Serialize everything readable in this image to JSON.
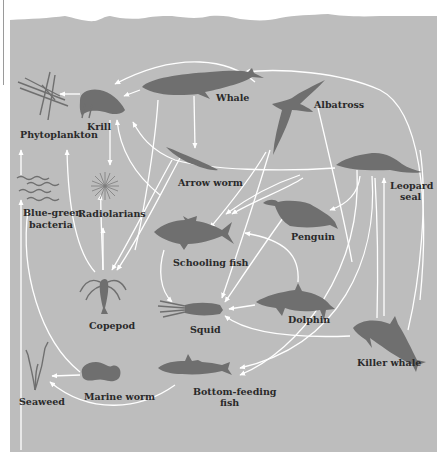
{
  "diagram": {
    "colors": {
      "water": "#bdbdbd",
      "silhouette": "#6f6f6f",
      "arrow": "#ffffff",
      "label": "#2a2a2a",
      "page": "#ffffff"
    },
    "organisms": [
      {
        "id": "phytoplankton",
        "label": "Phytoplankton"
      },
      {
        "id": "krill",
        "label": "Krill"
      },
      {
        "id": "whale",
        "label": "Whale"
      },
      {
        "id": "albatross",
        "label": "Albatross"
      },
      {
        "id": "arrow-worm",
        "label": "Arrow worm"
      },
      {
        "id": "blue-green-bacteria",
        "label_line1": "Blue-green",
        "label_line2": "bacteria"
      },
      {
        "id": "radiolarians",
        "label": "Radiolarians"
      },
      {
        "id": "leopard-seal",
        "label_line1": "Leopard",
        "label_line2": "seal"
      },
      {
        "id": "penguin",
        "label": "Penguin"
      },
      {
        "id": "schooling-fish",
        "label": "Schooling fish"
      },
      {
        "id": "copepod",
        "label": "Copepod"
      },
      {
        "id": "squid",
        "label": "Squid"
      },
      {
        "id": "dolphin",
        "label": "Dolphin"
      },
      {
        "id": "killer-whale",
        "label": "Killer whale"
      },
      {
        "id": "seaweed",
        "label": "Seaweed"
      },
      {
        "id": "marine-worm",
        "label": "Marine worm"
      },
      {
        "id": "bottom-feeding-fish",
        "label_line1": "Bottom-feeding",
        "label_line2": "fish"
      }
    ],
    "edges": [
      {
        "from": "krill",
        "to": "phytoplankton"
      },
      {
        "from": "whale",
        "to": "krill"
      },
      {
        "from": "albatross",
        "to": "krill"
      },
      {
        "from": "leopard-seal",
        "to": "krill"
      },
      {
        "from": "whale",
        "to": "arrow-worm"
      },
      {
        "from": "whale",
        "to": "copepod"
      },
      {
        "from": "krill",
        "to": "radiolarians"
      },
      {
        "from": "blue-green-bacteria",
        "to": "phytoplankton"
      },
      {
        "from": "copepod",
        "to": "phytoplankton"
      },
      {
        "from": "copepod",
        "to": "krill"
      },
      {
        "from": "arrow-worm",
        "to": "copepod"
      },
      {
        "from": "schooling-fish",
        "to": "copepod"
      },
      {
        "from": "albatross",
        "to": "schooling-fish"
      },
      {
        "from": "albatross",
        "to": "squid"
      },
      {
        "from": "penguin",
        "to": "schooling-fish"
      },
      {
        "from": "penguin",
        "to": "squid"
      },
      {
        "from": "leopard-seal",
        "to": "penguin"
      },
      {
        "from": "schooling-fish",
        "to": "squid"
      },
      {
        "from": "dolphin",
        "to": "schooling-fish"
      },
      {
        "from": "dolphin",
        "to": "squid"
      },
      {
        "from": "killer-whale",
        "to": "squid"
      },
      {
        "from": "killer-whale",
        "to": "leopard-seal"
      },
      {
        "from": "killer-whale",
        "to": "albatross"
      },
      {
        "from": "killer-whale",
        "to": "bottom-feeding-fish"
      },
      {
        "from": "leopard-seal",
        "to": "bottom-feeding-fish"
      },
      {
        "from": "marine-worm",
        "to": "seaweed"
      },
      {
        "from": "bottom-feeding-fish",
        "to": "seaweed"
      },
      {
        "from": "marine-worm",
        "to": "phytoplankton"
      }
    ]
  }
}
